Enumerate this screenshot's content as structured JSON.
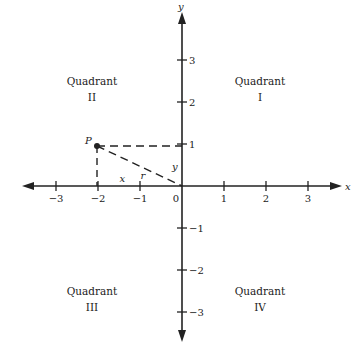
{
  "diagram": {
    "type": "cartesian-plane",
    "axes": {
      "x_label": "x",
      "y_label": "y",
      "x_range": [
        -3,
        3
      ],
      "y_range": [
        -3,
        3
      ],
      "x_ticks": [
        {
          "value": -3,
          "label": "−3"
        },
        {
          "value": -2,
          "label": "−2"
        },
        {
          "value": -1,
          "label": "−1"
        },
        {
          "value": 1,
          "label": "1"
        },
        {
          "value": 2,
          "label": "2"
        },
        {
          "value": 3,
          "label": "3"
        }
      ],
      "y_ticks": [
        {
          "value": 3,
          "label": "3"
        },
        {
          "value": 2,
          "label": "2"
        },
        {
          "value": 1,
          "label": "1"
        },
        {
          "value": -1,
          "label": "−1"
        },
        {
          "value": -2,
          "label": "−2"
        },
        {
          "value": -3,
          "label": "−3"
        }
      ],
      "origin_label": "0"
    },
    "quadrants": [
      {
        "name": "Quadrant",
        "numeral": "I",
        "x": 2,
        "y": 2.5
      },
      {
        "name": "Quadrant",
        "numeral": "II",
        "x": -2,
        "y": 2.5
      },
      {
        "name": "Quadrant",
        "numeral": "III",
        "x": -2,
        "y": -2.5
      },
      {
        "name": "Quadrant",
        "numeral": "IV",
        "x": 2,
        "y": -2.5
      }
    ],
    "point": {
      "label": "P",
      "x": -2,
      "y": 1
    },
    "segment_labels": {
      "x": "x",
      "y": "y",
      "r": "r"
    }
  }
}
